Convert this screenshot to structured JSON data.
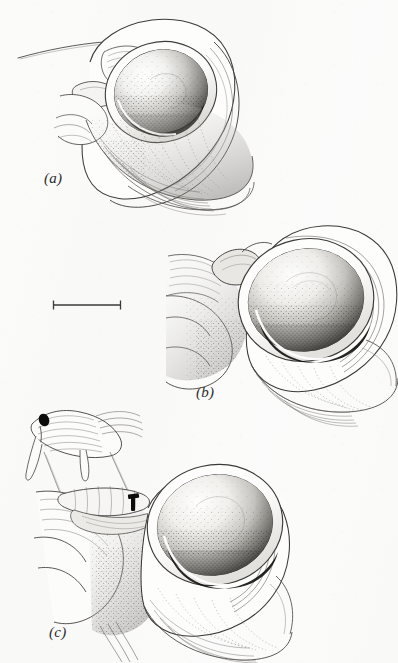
{
  "plate": {
    "kind": "scientific-illustration-plate",
    "medium": "pen-and-ink stipple drawing",
    "subject": "gastropod shell apertures with operculum and soft tissue",
    "background_color": "#fbfbfa",
    "ink_color": "#2b2b2b",
    "width": 398,
    "height": 663
  },
  "labels": {
    "a": "(a)",
    "b": "(b)",
    "c": "(c)"
  },
  "scale_bar": {
    "name": "scale-bar",
    "x1": 53,
    "x2": 121,
    "y": 305,
    "cap_height": 9,
    "length_px": 68,
    "color": "#3a3a3a"
  },
  "figures": [
    {
      "id": "a",
      "label": "(a)",
      "label_x": 44,
      "label_y": 170,
      "description": "Shell aperture viewed obliquely; dark stippled operculum seated in aperture, fine tentacle line extending to upper left, radiating growth lines across lower shell body.",
      "features": [
        "tentacle-line",
        "aperture-rim",
        "operculum",
        "growth-lines",
        "columellar-folds"
      ]
    },
    {
      "id": "b",
      "label": "(b)",
      "label_x": 196,
      "label_y": 384,
      "description": "Larger aperture view with broad stippled operculum filling aperture, raised siphonal projection upper left, scalloped lobed foot margin to the left.",
      "features": [
        "siphonal-projection",
        "aperture-rim",
        "operculum",
        "scalloped-foot-margin",
        "growth-lines"
      ]
    },
    {
      "id": "c",
      "label": "(c)",
      "label_x": 49,
      "label_y": 624,
      "description": "Aperture with operculum plus enlarged inset of tentacle tip bearing dark ocellus, connected by two thin leader lines; small dark ocellar mark on aperture margin.",
      "features": [
        "inset-tentacle-detail",
        "ocellus-dark-spot",
        "leader-line-left",
        "leader-line-right",
        "aperture-rim",
        "operculum",
        "growth-lines"
      ]
    }
  ]
}
